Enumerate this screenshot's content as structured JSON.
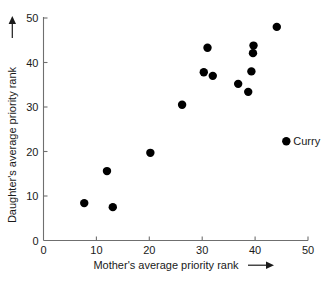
{
  "chart_data": {
    "type": "scatter",
    "title": "",
    "xlabel": "Mother's average priority rank",
    "ylabel": "Daughter's average priority rank",
    "xlabel_arrow": "⟶",
    "ylabel_arrow": "⟶",
    "xlim": [
      0,
      50
    ],
    "ylim": [
      0,
      50
    ],
    "xticks": [
      0,
      10,
      20,
      30,
      40,
      50
    ],
    "yticks": [
      0,
      10,
      20,
      30,
      40,
      50
    ],
    "xtick_labels": [
      "0",
      "10",
      "20",
      "30",
      "40",
      "50"
    ],
    "ytick_labels": [
      "0",
      "10",
      "20",
      "30",
      "40",
      "50"
    ],
    "grid": false,
    "legend": false,
    "marker": "filled-circle",
    "marker_color": "#000000",
    "marker_size_px": 4.6,
    "points": [
      {
        "x": 7.7,
        "y": 8.4,
        "label": ""
      },
      {
        "x": 12.0,
        "y": 15.6,
        "label": ""
      },
      {
        "x": 13.1,
        "y": 7.5,
        "label": ""
      },
      {
        "x": 20.2,
        "y": 19.7,
        "label": ""
      },
      {
        "x": 26.2,
        "y": 30.5,
        "label": ""
      },
      {
        "x": 30.3,
        "y": 37.8,
        "label": ""
      },
      {
        "x": 31.0,
        "y": 43.3,
        "label": ""
      },
      {
        "x": 32.0,
        "y": 37.0,
        "label": ""
      },
      {
        "x": 36.8,
        "y": 35.2,
        "label": ""
      },
      {
        "x": 38.7,
        "y": 33.4,
        "label": ""
      },
      {
        "x": 39.3,
        "y": 38.0,
        "label": ""
      },
      {
        "x": 39.6,
        "y": 42.1,
        "label": ""
      },
      {
        "x": 39.7,
        "y": 43.8,
        "label": ""
      },
      {
        "x": 44.1,
        "y": 48.0,
        "label": ""
      },
      {
        "x": 45.9,
        "y": 22.3,
        "label": "Curry"
      }
    ],
    "annotations": [
      {
        "text": "Curry",
        "x": 45.9,
        "y": 22.3
      }
    ]
  },
  "colors": {
    "marker": "#000000",
    "axis": "#6f6f6f",
    "text": "#1a1a1a",
    "background": "#ffffff"
  }
}
